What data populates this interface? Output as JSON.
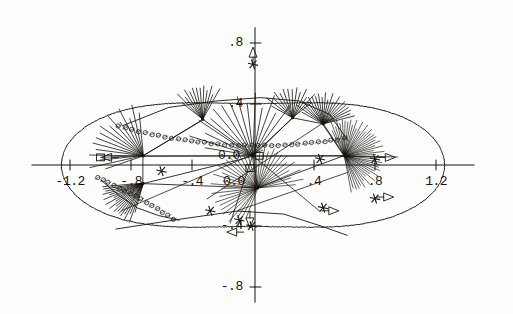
{
  "figure": {
    "kind": "scatter-ray-diagram",
    "background": "#fdfdfc",
    "ink_color": "#15140f",
    "width": 513,
    "height": 314
  },
  "axes": {
    "origin_px": {
      "x": 253,
      "y": 165
    },
    "px_per_unit": 152.5,
    "x_label_origin": "0.0",
    "y_label_origin": "0.0",
    "x_ticks": [
      {
        "value": -1.2,
        "label": "-1.2"
      },
      {
        "value": -0.8,
        "label": "-.8"
      },
      {
        "value": -0.4,
        "label": "-.4"
      },
      {
        "value": 0.4,
        "label": ".4"
      },
      {
        "value": 0.8,
        "label": ".8"
      },
      {
        "value": 1.2,
        "label": "1.2"
      }
    ],
    "y_ticks": [
      {
        "value": 0.8,
        "label": ".8"
      },
      {
        "value": 0.4,
        "label": ".4"
      },
      {
        "value": -0.4,
        "label": "-.4"
      },
      {
        "value": -0.8,
        "label": "-.8"
      }
    ],
    "x_range": [
      -1.45,
      1.45
    ],
    "y_range": [
      -0.9,
      0.9
    ]
  },
  "chart_data": {
    "type": "scatter",
    "title": "",
    "xlabel": "",
    "ylabel": "",
    "xlim": [
      -1.45,
      1.45
    ],
    "ylim": [
      -0.9,
      0.9
    ],
    "grid": false,
    "legend": "none",
    "boundary_curve": {
      "name": "cassini-oval-outer-boundary",
      "description": "closed peanut/figure-eight shaped outer contour",
      "a": 1.0,
      "c": 0.76
    },
    "fan_nodes": [
      {
        "id": "n1",
        "x": -0.72,
        "y": 0.06,
        "rays": 16,
        "angle_start": 200,
        "angle_end": 95,
        "length": 0.33,
        "density": "medium"
      },
      {
        "id": "n2",
        "x": -0.33,
        "y": 0.3,
        "rays": 13,
        "angle_start": 140,
        "angle_end": 62,
        "length": 0.22,
        "density": "medium"
      },
      {
        "id": "n3",
        "x": 0.0,
        "y": 0.06,
        "rays": 15,
        "angle_start": 170,
        "angle_end": 55,
        "length": 0.4,
        "density": "medium"
      },
      {
        "id": "n4",
        "x": 0.26,
        "y": 0.31,
        "rays": 14,
        "angle_start": 150,
        "angle_end": 40,
        "length": 0.2,
        "density": "medium"
      },
      {
        "id": "n5",
        "x": 0.46,
        "y": 0.27,
        "rays": 22,
        "angle_start": 150,
        "angle_end": 15,
        "length": 0.2,
        "density": "high"
      },
      {
        "id": "n6",
        "x": 0.6,
        "y": 0.06,
        "rays": 46,
        "angle_start": 115,
        "angle_end": -80,
        "length": 0.24,
        "density": "very-high"
      },
      {
        "id": "n7",
        "x": -0.72,
        "y": -0.12,
        "rays": 20,
        "angle_start": 255,
        "angle_end": 185,
        "length": 0.26,
        "density": "high"
      },
      {
        "id": "n8",
        "x": 0.03,
        "y": -0.15,
        "rays": 40,
        "angle_start": 250,
        "angle_end": 5,
        "length": 0.28,
        "density": "very-high"
      }
    ],
    "chain_markers": {
      "symbol": "circle-open",
      "description": "row of small open circles along the upper arc and lower-left arc",
      "upper_arc_count": 34,
      "lower_arc_count": 14
    },
    "star_markers": [
      {
        "x": 0.0,
        "y": 0.66
      },
      {
        "x": 0.44,
        "y": 0.04
      },
      {
        "x": 0.8,
        "y": 0.04
      },
      {
        "x": 0.8,
        "y": -0.22
      },
      {
        "x": 0.46,
        "y": -0.28
      },
      {
        "x": -0.09,
        "y": -0.36
      },
      {
        "x": -0.01,
        "y": -0.4
      },
      {
        "x": -0.6,
        "y": -0.04
      },
      {
        "x": -0.28,
        "y": -0.3
      }
    ],
    "arrow_markers": [
      {
        "x": 0.0,
        "y": 0.74,
        "dir": "up"
      },
      {
        "x": 0.9,
        "y": 0.05,
        "dir": "right"
      },
      {
        "x": 0.89,
        "y": -0.21,
        "dir": "right"
      },
      {
        "x": 0.53,
        "y": -0.3,
        "dir": "right"
      },
      {
        "x": -0.02,
        "y": -0.38,
        "dir": "down"
      },
      {
        "x": -0.14,
        "y": -0.44,
        "dir": "left"
      },
      {
        "x": -0.96,
        "y": 0.05,
        "dir": "left"
      }
    ],
    "polyline_segments": [
      {
        "name": "upper-chain-arc",
        "points": "-0.85,0.26 -0.55,0.38 -0.25,0.42 0.05,0.44 0.30,0.42 0.50,0.33 0.62,0.16"
      },
      {
        "name": "lower-chain-arc",
        "points": "-1.00,-0.10 -0.88,-0.20 -0.76,-0.28 -0.62,-0.33 -0.48,-0.36"
      },
      {
        "name": "lower-envelope",
        "points": "-0.90,-0.42 -0.50,-0.36 -0.10,-0.30 0.20,-0.32 0.45,-0.40 0.62,-0.46"
      }
    ]
  }
}
